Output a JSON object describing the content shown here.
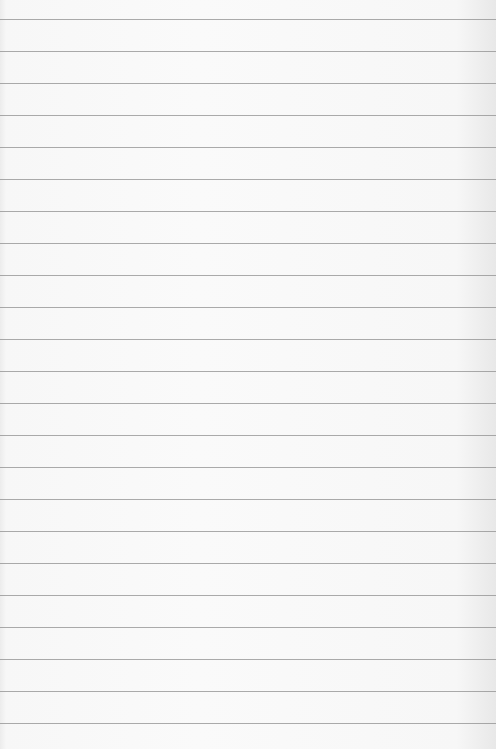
{
  "paper": {
    "type": "lined-paper",
    "background_color": "#f8f8f8",
    "line_color": "#8f8f8f",
    "first_line_y": 19,
    "line_spacing": 32,
    "line_count": 23
  }
}
